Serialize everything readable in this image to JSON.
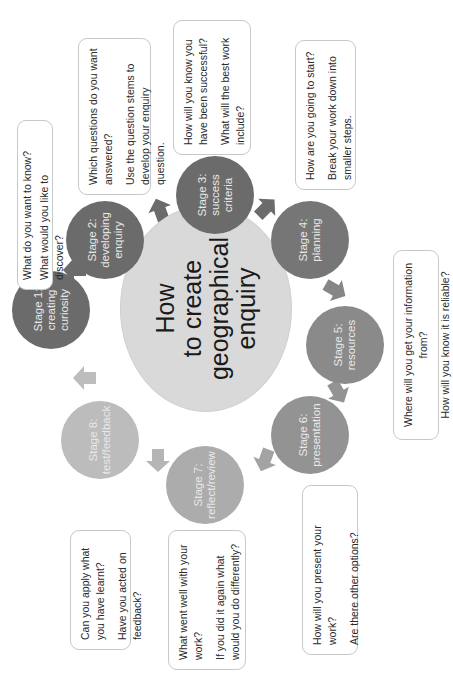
{
  "center": {
    "lines": [
      "How",
      "to create",
      "geographical",
      "enquiry"
    ]
  },
  "stages": [
    {
      "title": "Stage 1:",
      "lines": [
        "creating",
        "curiosity"
      ],
      "color": "#6b6b6b"
    },
    {
      "title": "Stage 2:",
      "lines": [
        "developing",
        "enquiry"
      ],
      "color": "#6b6b6b"
    },
    {
      "title": "Stage 3:",
      "lines": [
        "success",
        "criteria"
      ],
      "color": "#6b6b6b"
    },
    {
      "title": "Stage 4:",
      "lines": [
        "planning"
      ],
      "color": "#767676"
    },
    {
      "title": "Stage 5:",
      "lines": [
        "resources"
      ],
      "color": "#8a8a8a"
    },
    {
      "title": "Stage 6:",
      "lines": [
        "presentation"
      ],
      "color": "#939393"
    },
    {
      "title": "Stage 7:",
      "lines": [
        "reflect/review"
      ],
      "color": "#acacac"
    },
    {
      "title": "Stage 8:",
      "lines": [
        "test/feedback"
      ],
      "color": "#bcbcbc"
    }
  ],
  "boxes": [
    {
      "stage": 1,
      "questions": [
        "What do you want to know?",
        "What would you like to discover?"
      ]
    },
    {
      "stage": 2,
      "questions": [
        "Which questions do you want answered?",
        "Use the question stems to develop your enquiry question."
      ]
    },
    {
      "stage": 3,
      "questions": [
        "How will you know you have been successful?",
        "What will the best work include?"
      ]
    },
    {
      "stage": 4,
      "questions": [
        "How are you going to start?",
        "Break your work down into smaller steps."
      ]
    },
    {
      "stage": 5,
      "questions": [
        "Where will you get your information from?",
        "How will you know it is reliable?"
      ]
    },
    {
      "stage": 6,
      "questions": [
        "How will you present your work?",
        "Are there other options?"
      ]
    },
    {
      "stage": 7,
      "questions": [
        "What went well with your work?",
        "If you did it again what would you do differently?"
      ]
    },
    {
      "stage": 8,
      "questions": [
        "Can you apply what you have learnt?",
        "Have you acted on feedback?"
      ]
    }
  ],
  "colors": {
    "center_fill": "#d9d9d9",
    "arrow_dark": "#6b6b6b",
    "arrow_mid": "#8f8f8f",
    "arrow_light": "#b5b5b5",
    "box_border": "#c8c8c8"
  }
}
